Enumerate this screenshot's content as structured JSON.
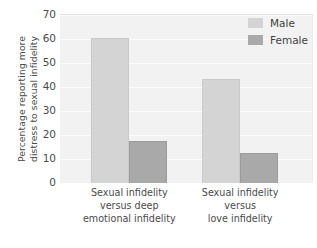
{
  "chart_data": {
    "type": "bar",
    "title": "",
    "xlabel": "",
    "ylabel_line1": "Percentage reporting more",
    "ylabel_line2": "distress to sexual infidelity",
    "categories": [
      "Sexual infidelity versus deep emotional infidelity",
      "Sexual infidelity versus love infidelity"
    ],
    "category_lines": [
      [
        "Sexual infidelity",
        "versus deep",
        "emotional infidelity"
      ],
      [
        "Sexual infidelity",
        "versus",
        "love infidelity"
      ]
    ],
    "series": [
      {
        "name": "Male",
        "color": "#d4d4d4",
        "values": [
          60,
          43
        ]
      },
      {
        "name": "Female",
        "color": "#a9a9a9",
        "values": [
          17,
          12
        ]
      }
    ],
    "ylim": [
      0,
      70
    ],
    "yticks": [
      0,
      10,
      20,
      30,
      40,
      50,
      60,
      70
    ],
    "ytick_labels": [
      "0",
      "10",
      "20",
      "30",
      "40",
      "50",
      "60",
      "70"
    ],
    "grid": true,
    "legend_position": "top-right",
    "legend_entries": [
      {
        "label": "Male",
        "color": "#d4d4d4"
      },
      {
        "label": "Female",
        "color": "#a9a9a9"
      }
    ]
  }
}
